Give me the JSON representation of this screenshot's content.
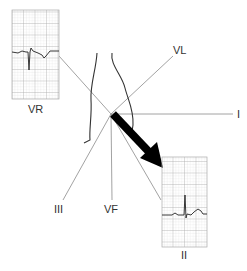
{
  "diagram": {
    "type": "hexaxial-lead-diagram",
    "leads": [
      {
        "id": "VR",
        "label": "VR"
      },
      {
        "id": "VL",
        "label": "VL"
      },
      {
        "id": "I",
        "label": "I"
      },
      {
        "id": "III",
        "label": "III"
      },
      {
        "id": "VF",
        "label": "VF"
      },
      {
        "id": "II",
        "label": "II"
      }
    ],
    "strips": [
      {
        "lead": "VR",
        "label": "VR",
        "complex": "negative"
      },
      {
        "lead": "II",
        "label": "II",
        "complex": "positive"
      }
    ],
    "axis_arrow": {
      "direction": "toward II",
      "color": "#000000"
    },
    "colors": {
      "lines": "#888888",
      "grid": "#bbbbbb",
      "trace": "#222222",
      "arrow": "#000000"
    }
  }
}
